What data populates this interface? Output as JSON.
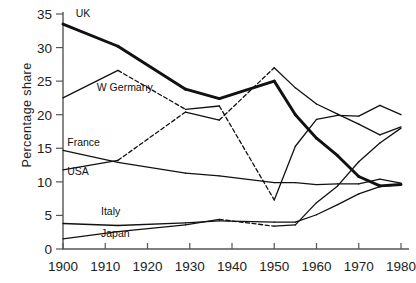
{
  "chart_data": {
    "type": "line",
    "title": "",
    "xlabel": "",
    "ylabel": "Percentage share",
    "xlim": [
      1900,
      1980
    ],
    "ylim": [
      0,
      35
    ],
    "xticks": [
      1900,
      1910,
      1920,
      1930,
      1940,
      1950,
      1960,
      1970,
      1980
    ],
    "yticks": [
      0,
      5,
      10,
      15,
      20,
      25,
      30,
      35
    ],
    "grid": false,
    "legend": "inline-labels",
    "series": [
      {
        "name": "UK",
        "label": "UK",
        "style": "thick",
        "label_x": 1903,
        "label_y": 34.6,
        "points": [
          {
            "x": 1900,
            "y": 33.5
          },
          {
            "x": 1913,
            "y": 30.2
          },
          {
            "x": 1929,
            "y": 23.8
          },
          {
            "x": 1937,
            "y": 22.4
          },
          {
            "x": 1950,
            "y": 25.0
          },
          {
            "x": 1955,
            "y": 20.0
          },
          {
            "x": 1960,
            "y": 16.5
          },
          {
            "x": 1965,
            "y": 13.9
          },
          {
            "x": 1970,
            "y": 10.8
          },
          {
            "x": 1975,
            "y": 9.4
          },
          {
            "x": 1980,
            "y": 9.6
          }
        ],
        "dashed_segments": [
          [
            1913,
            1918
          ]
        ]
      },
      {
        "name": "W Germany",
        "label": "W Germany",
        "style": "thin",
        "label_x": 1908,
        "label_y": 23.6,
        "points": [
          {
            "x": 1900,
            "y": 22.5
          },
          {
            "x": 1913,
            "y": 26.6
          },
          {
            "x": 1929,
            "y": 20.8
          },
          {
            "x": 1937,
            "y": 21.3
          },
          {
            "x": 1950,
            "y": 7.3
          },
          {
            "x": 1955,
            "y": 15.3
          },
          {
            "x": 1960,
            "y": 19.3
          },
          {
            "x": 1965,
            "y": 19.9
          },
          {
            "x": 1970,
            "y": 19.8
          },
          {
            "x": 1975,
            "y": 21.4
          },
          {
            "x": 1980,
            "y": 20.0
          }
        ],
        "dashed_segments": [
          [
            1913,
            1922
          ],
          [
            1937,
            1947
          ]
        ]
      },
      {
        "name": "France",
        "label": "France",
        "style": "thin",
        "label_x": 1901,
        "label_y": 15.4,
        "points": [
          {
            "x": 1900,
            "y": 14.7
          },
          {
            "x": 1913,
            "y": 12.9
          },
          {
            "x": 1929,
            "y": 11.3
          },
          {
            "x": 1937,
            "y": 10.9
          },
          {
            "x": 1950,
            "y": 9.9
          },
          {
            "x": 1955,
            "y": 9.9
          },
          {
            "x": 1960,
            "y": 9.6
          },
          {
            "x": 1965,
            "y": 9.7
          },
          {
            "x": 1970,
            "y": 9.7
          },
          {
            "x": 1975,
            "y": 10.4
          },
          {
            "x": 1980,
            "y": 9.8
          }
        ],
        "dashed_segments": [
          [
            1913,
            1921
          ]
        ]
      },
      {
        "name": "USA",
        "label": "USA",
        "style": "thin",
        "label_x": 1901,
        "label_y": 11.0,
        "points": [
          {
            "x": 1900,
            "y": 11.8
          },
          {
            "x": 1913,
            "y": 13.2
          },
          {
            "x": 1929,
            "y": 20.4
          },
          {
            "x": 1937,
            "y": 19.2
          },
          {
            "x": 1950,
            "y": 27.0
          },
          {
            "x": 1955,
            "y": 24.0
          },
          {
            "x": 1960,
            "y": 21.6
          },
          {
            "x": 1965,
            "y": 20.1
          },
          {
            "x": 1970,
            "y": 18.6
          },
          {
            "x": 1975,
            "y": 17.0
          },
          {
            "x": 1980,
            "y": 18.2
          }
        ],
        "dashed_segments": [
          [
            1913,
            1924
          ],
          [
            1937,
            1950
          ]
        ]
      },
      {
        "name": "Italy",
        "label": "Italy",
        "style": "thin",
        "label_x": 1909,
        "label_y": 5.1,
        "points": [
          {
            "x": 1900,
            "y": 3.8
          },
          {
            "x": 1913,
            "y": 3.5
          },
          {
            "x": 1929,
            "y": 3.9
          },
          {
            "x": 1937,
            "y": 4.2
          },
          {
            "x": 1950,
            "y": 4.0
          },
          {
            "x": 1955,
            "y": 4.0
          },
          {
            "x": 1960,
            "y": 5.1
          },
          {
            "x": 1965,
            "y": 6.6
          },
          {
            "x": 1970,
            "y": 8.2
          },
          {
            "x": 1975,
            "y": 9.3
          },
          {
            "x": 1980,
            "y": 9.6
          }
        ],
        "dashed_segments": [
          [
            1913,
            1921
          ]
        ]
      },
      {
        "name": "Japan",
        "label": "Japan",
        "style": "thin",
        "label_x": 1909,
        "label_y": 1.8,
        "points": [
          {
            "x": 1900,
            "y": 1.5
          },
          {
            "x": 1913,
            "y": 2.6
          },
          {
            "x": 1929,
            "y": 3.6
          },
          {
            "x": 1937,
            "y": 4.4
          },
          {
            "x": 1950,
            "y": 3.4
          },
          {
            "x": 1955,
            "y": 3.6
          },
          {
            "x": 1960,
            "y": 6.9
          },
          {
            "x": 1965,
            "y": 9.4
          },
          {
            "x": 1970,
            "y": 13.0
          },
          {
            "x": 1975,
            "y": 15.8
          },
          {
            "x": 1980,
            "y": 18.0
          }
        ],
        "dashed_segments": [
          [
            1937,
            1948
          ]
        ]
      }
    ]
  },
  "axes": {
    "y_title": "Percentage share",
    "x_tick_labels": [
      "1900",
      "1910",
      "1920",
      "1930",
      "1940",
      "1950",
      "1960",
      "1970",
      "1980"
    ],
    "y_tick_labels": [
      "0",
      "5",
      "10",
      "15",
      "20",
      "25",
      "30",
      "35"
    ],
    "axis_color": "#555555",
    "line_color": "#111111"
  },
  "series_labels": {
    "uk": "UK",
    "w_germany": "W Germany",
    "france": "France",
    "usa": "USA",
    "italy": "Italy",
    "japan": "Japan"
  }
}
